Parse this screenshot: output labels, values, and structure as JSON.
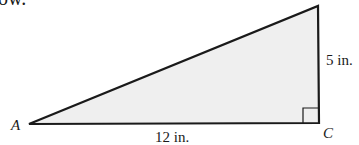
{
  "header": {
    "clipped_text": "ow."
  },
  "figure": {
    "type": "right-triangle",
    "fill_color": "#efefef",
    "stroke_color": "#1a1a1a",
    "vertices": {
      "A": {
        "label": "A"
      },
      "C": {
        "label": "C",
        "right_angle": true
      },
      "B": {
        "label": ""
      }
    },
    "sides": {
      "AC": {
        "label": "12 in."
      },
      "BC": {
        "label": "5 in."
      }
    }
  }
}
